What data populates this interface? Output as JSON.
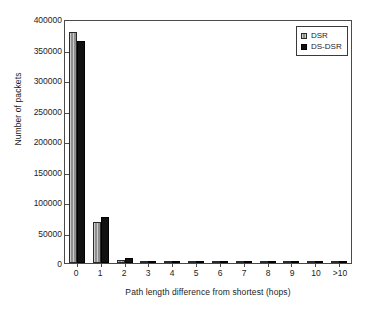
{
  "chart_data": {
    "type": "bar",
    "title": "",
    "xlabel": "Path length difference from shortest (hops)",
    "ylabel": "Number of packets",
    "categories": [
      "0",
      "1",
      "2",
      "3",
      "4",
      "5",
      "6",
      "7",
      "8",
      "9",
      "10",
      ">10"
    ],
    "series": [
      {
        "name": "DSR",
        "color": "#8f8f8f",
        "values": [
          378000,
          67000,
          5000,
          1500,
          500,
          300,
          200,
          150,
          100,
          80,
          60,
          200
        ]
      },
      {
        "name": "DS-DSR",
        "color": "#111111",
        "values": [
          364000,
          76000,
          8000,
          1800,
          600,
          350,
          250,
          180,
          120,
          90,
          70,
          250
        ]
      }
    ],
    "ylim": [
      0,
      400000
    ],
    "yticks": [
      0,
      50000,
      100000,
      150000,
      200000,
      250000,
      300000,
      350000,
      400000
    ],
    "ytick_labels": [
      "0",
      "50000",
      "100000",
      "150000",
      "200000",
      "250000",
      "300000",
      "350000",
      "400000"
    ],
    "grid": false,
    "legend_position": "top-right"
  }
}
